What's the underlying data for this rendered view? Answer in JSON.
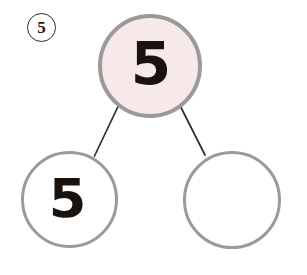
{
  "page": {
    "background_color": "#ffffff",
    "width": 307,
    "height": 275
  },
  "problem": {
    "number_label": "5",
    "number_badge_glyph": "⑤"
  },
  "number_bond": {
    "type": "number-bond",
    "whole": {
      "label": "whole",
      "value": "5",
      "fill_color": "#f7e9ea",
      "border_color": "#9b9a99",
      "filled_in": true
    },
    "parts": [
      {
        "label": "part-left",
        "value": "5",
        "fill_color": "#ffffff",
        "border_color": "#9b9a99",
        "filled_in": true
      },
      {
        "label": "part-right",
        "value": "",
        "fill_color": "#ffffff",
        "border_color": "#9b9a99",
        "filled_in": false
      }
    ],
    "connector_color": "#2f2b29"
  }
}
